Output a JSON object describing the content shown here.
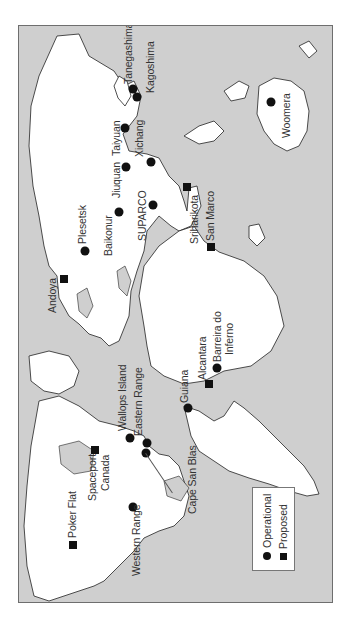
{
  "map": {
    "title": "World launch sites",
    "orientation": "rotated 90 degrees counter-clockwise",
    "colors": {
      "ocean": "#cfcfcf",
      "land": "#ffffff",
      "marker": "#111111",
      "border": "#6e6e6e"
    }
  },
  "legend": {
    "items": [
      {
        "symbol": "circle",
        "label": "Operational"
      },
      {
        "symbol": "square",
        "label": "Proposed"
      }
    ]
  },
  "sites": [
    {
      "name": "Tanegashima",
      "status": "Operational"
    },
    {
      "name": "Kagoshima",
      "status": "Operational"
    },
    {
      "name": "Taiyuan",
      "status": "Operational"
    },
    {
      "name": "Jiuquan",
      "status": "Operational"
    },
    {
      "name": "Xichang",
      "status": "Operational"
    },
    {
      "name": "Woomera",
      "status": "Operational"
    },
    {
      "name": "SUPARCO",
      "status": "Operational"
    },
    {
      "name": "Baikonur",
      "status": "Operational"
    },
    {
      "name": "Sriharikota",
      "status": "Proposed"
    },
    {
      "name": "San Marco",
      "status": "Proposed"
    },
    {
      "name": "Plesetsk",
      "status": "Operational"
    },
    {
      "name": "Andoya",
      "status": "Proposed"
    },
    {
      "name": "Barreira do",
      "status": "Operational",
      "line2": "Inferno"
    },
    {
      "name": "Alcantara",
      "status": "Proposed"
    },
    {
      "name": "Guiana",
      "status": "Operational"
    },
    {
      "name": "Wallops Island",
      "status": "Operational"
    },
    {
      "name": "Eastern Range",
      "status": "Operational"
    },
    {
      "name": "Cape San Blas",
      "status": "Operational"
    },
    {
      "name": "Spaceport",
      "status": "Proposed",
      "line2": "Canada"
    },
    {
      "name": "Western Range",
      "status": "Operational"
    },
    {
      "name": "Poker Flat",
      "status": "Proposed"
    }
  ]
}
